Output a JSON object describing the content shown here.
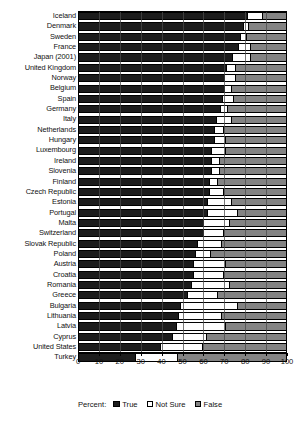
{
  "chart_data": {
    "type": "bar",
    "orientation": "horizontal",
    "stacked": true,
    "title": "",
    "xlabel": "Percent:",
    "ylabel": "",
    "xlim": [
      0,
      100
    ],
    "xticks": [
      0,
      10,
      20,
      30,
      40,
      50,
      60,
      70,
      80,
      90,
      100
    ],
    "grid": true,
    "legend_position": "bottom",
    "legend_title": "Percent:",
    "categories": [
      "Iceland",
      "Denmark",
      "Sweden",
      "France",
      "Japan (2001)",
      "United Kingdom",
      "Norway",
      "Belgium",
      "Spain",
      "Germany",
      "Italy",
      "Netherlands",
      "Hungary",
      "Luxembourg",
      "Ireland",
      "Slovenia",
      "Finland",
      "Czech Republic",
      "Estonia",
      "Portugal",
      "Malta",
      "Switzerland",
      "Slovak Republic",
      "Poland",
      "Austria",
      "Croatia",
      "Romania",
      "Greece",
      "Bulgaria",
      "Lithuania",
      "Latvia",
      "Cyprus",
      "United States",
      "Turkey"
    ],
    "series": [
      {
        "name": "True",
        "color": "#1c1c1c",
        "values": [
          81,
          79,
          78,
          77,
          74,
          71,
          70,
          70,
          69,
          68,
          66,
          65,
          65,
          64,
          64,
          64,
          63,
          63,
          62,
          62,
          60,
          60,
          57,
          56,
          55,
          55,
          54,
          52,
          49,
          48,
          47,
          45,
          39,
          27
        ]
      },
      {
        "name": "Not Sure",
        "color": "#ffffff",
        "values": [
          8,
          3,
          3,
          6,
          9,
          5,
          6,
          4,
          6,
          4,
          8,
          5,
          6,
          7,
          4,
          4,
          4,
          7,
          12,
          15,
          13,
          10,
          12,
          8,
          16,
          15,
          19,
          15,
          28,
          21,
          24,
          17,
          21,
          21
        ]
      },
      {
        "name": "False",
        "color": "#838383",
        "values": [
          11,
          18,
          19,
          17,
          17,
          24,
          24,
          26,
          25,
          28,
          26,
          30,
          29,
          29,
          32,
          32,
          33,
          30,
          26,
          23,
          27,
          30,
          31,
          36,
          29,
          30,
          27,
          33,
          23,
          31,
          29,
          38,
          40,
          52
        ]
      }
    ]
  },
  "legend": {
    "title": "Percent:",
    "items": [
      {
        "label": "True"
      },
      {
        "label": "Not Sure"
      },
      {
        "label": "False"
      }
    ]
  }
}
